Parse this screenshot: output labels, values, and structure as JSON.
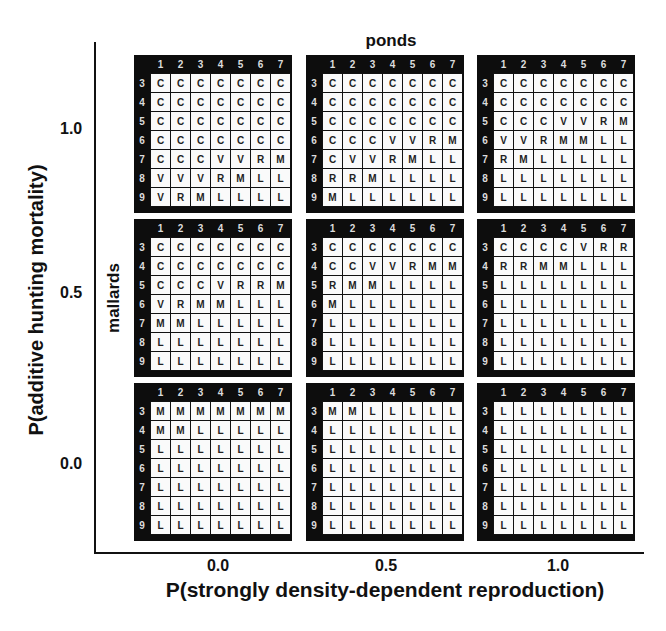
{
  "chart_data": {
    "type": "table",
    "title": "",
    "xlabel": "P(strongly density-dependent reproduction)",
    "ylabel": "P(additive hunting mortality)",
    "x_ticks": [
      "0.0",
      "0.5",
      "1.0"
    ],
    "y_ticks": [
      "1.0",
      "0.5",
      "0.0"
    ],
    "inner_column_label": "ponds",
    "inner_row_label": "mallards",
    "inner_column_ticks": [
      "1",
      "2",
      "3",
      "4",
      "5",
      "6",
      "7"
    ],
    "inner_row_ticks": [
      "3",
      "4",
      "5",
      "6",
      "7",
      "8",
      "9"
    ],
    "panels": [
      {
        "x": "0.0",
        "y": "1.0",
        "rows": [
          [
            "C",
            "C",
            "C",
            "C",
            "C",
            "C",
            "C"
          ],
          [
            "C",
            "C",
            "C",
            "C",
            "C",
            "C",
            "C"
          ],
          [
            "C",
            "C",
            "C",
            "C",
            "C",
            "C",
            "C"
          ],
          [
            "C",
            "C",
            "C",
            "C",
            "C",
            "C",
            "C"
          ],
          [
            "C",
            "C",
            "C",
            "V",
            "V",
            "R",
            "M"
          ],
          [
            "V",
            "V",
            "V",
            "R",
            "M",
            "L",
            "L"
          ],
          [
            "V",
            "R",
            "M",
            "L",
            "L",
            "L",
            "L"
          ]
        ]
      },
      {
        "x": "0.5",
        "y": "1.0",
        "rows": [
          [
            "C",
            "C",
            "C",
            "C",
            "C",
            "C",
            "C"
          ],
          [
            "C",
            "C",
            "C",
            "C",
            "C",
            "C",
            "C"
          ],
          [
            "C",
            "C",
            "C",
            "C",
            "C",
            "C",
            "C"
          ],
          [
            "C",
            "C",
            "C",
            "V",
            "V",
            "R",
            "M"
          ],
          [
            "C",
            "V",
            "V",
            "R",
            "M",
            "L",
            "L"
          ],
          [
            "R",
            "R",
            "M",
            "L",
            "L",
            "L",
            "L"
          ],
          [
            "M",
            "L",
            "L",
            "L",
            "L",
            "L",
            "L"
          ]
        ]
      },
      {
        "x": "1.0",
        "y": "1.0",
        "rows": [
          [
            "C",
            "C",
            "C",
            "C",
            "C",
            "C",
            "C"
          ],
          [
            "C",
            "C",
            "C",
            "C",
            "C",
            "C",
            "C"
          ],
          [
            "C",
            "C",
            "C",
            "V",
            "V",
            "R",
            "M"
          ],
          [
            "V",
            "V",
            "R",
            "M",
            "M",
            "L",
            "L"
          ],
          [
            "R",
            "M",
            "L",
            "L",
            "L",
            "L",
            "L"
          ],
          [
            "L",
            "L",
            "L",
            "L",
            "L",
            "L",
            "L"
          ],
          [
            "L",
            "L",
            "L",
            "L",
            "L",
            "L",
            "L"
          ]
        ]
      },
      {
        "x": "0.0",
        "y": "0.5",
        "rows": [
          [
            "C",
            "C",
            "C",
            "C",
            "C",
            "C",
            "C"
          ],
          [
            "C",
            "C",
            "C",
            "C",
            "C",
            "C",
            "C"
          ],
          [
            "C",
            "C",
            "C",
            "V",
            "R",
            "R",
            "M"
          ],
          [
            "V",
            "R",
            "M",
            "M",
            "L",
            "L",
            "L"
          ],
          [
            "M",
            "M",
            "L",
            "L",
            "L",
            "L",
            "L"
          ],
          [
            "L",
            "L",
            "L",
            "L",
            "L",
            "L",
            "L"
          ],
          [
            "L",
            "L",
            "L",
            "L",
            "L",
            "L",
            "L"
          ]
        ]
      },
      {
        "x": "0.5",
        "y": "0.5",
        "rows": [
          [
            "C",
            "C",
            "C",
            "C",
            "C",
            "C",
            "C"
          ],
          [
            "C",
            "C",
            "V",
            "V",
            "R",
            "M",
            "M"
          ],
          [
            "R",
            "M",
            "M",
            "L",
            "L",
            "L",
            "L"
          ],
          [
            "M",
            "L",
            "L",
            "L",
            "L",
            "L",
            "L"
          ],
          [
            "L",
            "L",
            "L",
            "L",
            "L",
            "L",
            "L"
          ],
          [
            "L",
            "L",
            "L",
            "L",
            "L",
            "L",
            "L"
          ],
          [
            "L",
            "L",
            "L",
            "L",
            "L",
            "L",
            "L"
          ]
        ]
      },
      {
        "x": "1.0",
        "y": "0.5",
        "rows": [
          [
            "C",
            "C",
            "C",
            "C",
            "V",
            "R",
            "R"
          ],
          [
            "R",
            "R",
            "M",
            "M",
            "L",
            "L",
            "L"
          ],
          [
            "L",
            "L",
            "L",
            "L",
            "L",
            "L",
            "L"
          ],
          [
            "L",
            "L",
            "L",
            "L",
            "L",
            "L",
            "L"
          ],
          [
            "L",
            "L",
            "L",
            "L",
            "L",
            "L",
            "L"
          ],
          [
            "L",
            "L",
            "L",
            "L",
            "L",
            "L",
            "L"
          ],
          [
            "L",
            "L",
            "L",
            "L",
            "L",
            "L",
            "L"
          ]
        ]
      },
      {
        "x": "0.0",
        "y": "0.0",
        "rows": [
          [
            "M",
            "M",
            "M",
            "M",
            "M",
            "M",
            "M"
          ],
          [
            "M",
            "M",
            "L",
            "L",
            "L",
            "L",
            "L"
          ],
          [
            "L",
            "L",
            "L",
            "L",
            "L",
            "L",
            "L"
          ],
          [
            "L",
            "L",
            "L",
            "L",
            "L",
            "L",
            "L"
          ],
          [
            "L",
            "L",
            "L",
            "L",
            "L",
            "L",
            "L"
          ],
          [
            "L",
            "L",
            "L",
            "L",
            "L",
            "L",
            "L"
          ],
          [
            "L",
            "L",
            "L",
            "L",
            "L",
            "L",
            "L"
          ]
        ]
      },
      {
        "x": "0.5",
        "y": "0.0",
        "rows": [
          [
            "M",
            "M",
            "L",
            "L",
            "L",
            "L",
            "L"
          ],
          [
            "L",
            "L",
            "L",
            "L",
            "L",
            "L",
            "L"
          ],
          [
            "L",
            "L",
            "L",
            "L",
            "L",
            "L",
            "L"
          ],
          [
            "L",
            "L",
            "L",
            "L",
            "L",
            "L",
            "L"
          ],
          [
            "L",
            "L",
            "L",
            "L",
            "L",
            "L",
            "L"
          ],
          [
            "L",
            "L",
            "L",
            "L",
            "L",
            "L",
            "L"
          ],
          [
            "L",
            "L",
            "L",
            "L",
            "L",
            "L",
            "L"
          ]
        ]
      },
      {
        "x": "1.0",
        "y": "0.0",
        "rows": [
          [
            "L",
            "L",
            "L",
            "L",
            "L",
            "L",
            "L"
          ],
          [
            "L",
            "L",
            "L",
            "L",
            "L",
            "L",
            "L"
          ],
          [
            "L",
            "L",
            "L",
            "L",
            "L",
            "L",
            "L"
          ],
          [
            "L",
            "L",
            "L",
            "L",
            "L",
            "L",
            "L"
          ],
          [
            "L",
            "L",
            "L",
            "L",
            "L",
            "L",
            "L"
          ],
          [
            "L",
            "L",
            "L",
            "L",
            "L",
            "L",
            "L"
          ],
          [
            "L",
            "L",
            "L",
            "L",
            "L",
            "L",
            "L"
          ]
        ]
      }
    ],
    "layout": {
      "grid": false,
      "legend": "none",
      "panel_grid": "3x3"
    }
  }
}
